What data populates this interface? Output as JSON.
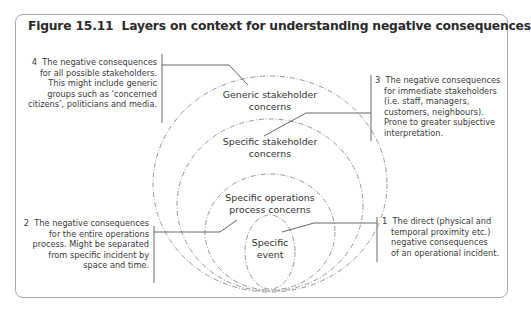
{
  "figure": {
    "number": "Figure 15.11",
    "title": "Layers on context for understanding negative consequences"
  },
  "circles": [
    {
      "id": "generic",
      "label_lines": [
        "Generic stakeholder",
        "concerns"
      ]
    },
    {
      "id": "specific-stakeholder",
      "label_lines": [
        "Specific stakeholder",
        "concerns"
      ]
    },
    {
      "id": "operations",
      "label_lines": [
        "Specific operations",
        "process concerns"
      ]
    },
    {
      "id": "event",
      "label_lines": [
        "Specific",
        "event"
      ]
    }
  ],
  "notes": [
    {
      "number": "4",
      "lines": [
        "The negative consequences",
        "for all possible stakeholders.",
        "This might include generic",
        "groups such as ‘concerned",
        "citizens’, politicians and media."
      ]
    },
    {
      "number": "3",
      "lines": [
        "The negative consequences",
        "for immediate stakeholders",
        "(i.e. staff, managers,",
        "customers, neighbours).",
        "Prone to greater subjective",
        "interpretation."
      ]
    },
    {
      "number": "2",
      "lines": [
        "The negative consequences",
        "for the entire operations",
        "process. Might be separated",
        "from specific incident by",
        "space and time."
      ]
    },
    {
      "number": "1",
      "lines": [
        "The direct (physical and",
        "temporal proximity etc.)",
        "negative consequences",
        "of an operational incident."
      ]
    }
  ],
  "colors": {
    "frame_border": "#a8a8a8",
    "circle_stroke": "#8a8a8a",
    "leader_line": "#555555"
  }
}
